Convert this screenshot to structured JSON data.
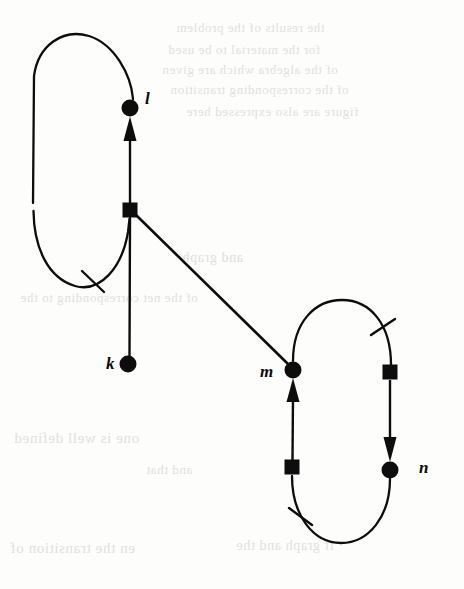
{
  "page": {
    "width": 464,
    "height": 589,
    "background_color": "#fdfdfc",
    "ink_color": "#0d0d0d"
  },
  "diagram": {
    "type": "petri-net",
    "stroke_color": "#0d0d0d",
    "places": [
      {
        "id": "k",
        "label": "k",
        "shape": "filled-circle",
        "cx": 128,
        "cy": 364,
        "r": 8.5,
        "label_x": 106,
        "label_y": 355
      },
      {
        "id": "l",
        "label": "l",
        "shape": "filled-circle",
        "cx": 130,
        "cy": 108,
        "r": 8.5,
        "label_x": 145,
        "label_y": 90
      },
      {
        "id": "m",
        "label": "m",
        "shape": "filled-circle",
        "cx": 293,
        "cy": 370,
        "r": 8.5,
        "label_x": 260,
        "label_y": 363
      },
      {
        "id": "n",
        "label": "n",
        "shape": "filled-circle",
        "cx": 390,
        "cy": 470,
        "r": 8.5,
        "label_x": 419,
        "label_y": 459
      }
    ],
    "transitions": [
      {
        "id": "t1",
        "shape": "filled-square",
        "cx": 130,
        "cy": 210,
        "size": 15
      },
      {
        "id": "t2",
        "shape": "filled-square",
        "cx": 390,
        "cy": 372,
        "size": 15
      },
      {
        "id": "t3",
        "shape": "filled-square",
        "cx": 292,
        "cy": 467,
        "size": 15
      }
    ],
    "arcs": [
      {
        "id": "arc-k-t1",
        "from": "k",
        "to": "t1",
        "kind": "straight",
        "arrowhead": false
      },
      {
        "id": "arc-t1-l",
        "from": "t1",
        "to": "l",
        "kind": "straight",
        "arrowhead": true
      },
      {
        "id": "arc-l-t1-loop",
        "from": "l",
        "to": "t1",
        "kind": "left-loop",
        "arrowhead": false,
        "tick": true
      },
      {
        "id": "arc-t1-m",
        "from": "t1",
        "to": "m",
        "kind": "diagonal",
        "arrowhead": false
      },
      {
        "id": "arc-t3-m",
        "from": "t3",
        "to": "m",
        "kind": "straight",
        "arrowhead": true
      },
      {
        "id": "arc-m-t2",
        "from": "m",
        "to": "t2",
        "kind": "right-loop-top",
        "arrowhead": false,
        "tick": true
      },
      {
        "id": "arc-t2-n",
        "from": "t2",
        "to": "n",
        "kind": "straight",
        "arrowhead": true
      },
      {
        "id": "arc-n-t3",
        "from": "n",
        "to": "t3",
        "kind": "right-loop-bottom",
        "arrowhead": false,
        "tick": true
      }
    ],
    "tick_marks": [
      {
        "id": "tick-left-loop",
        "x": 93,
        "y": 281,
        "angle": 62
      },
      {
        "id": "tick-right-upper",
        "x": 383,
        "y": 327,
        "angle": 65
      },
      {
        "id": "tick-right-lower",
        "x": 300,
        "y": 516,
        "angle": 60
      }
    ]
  },
  "bleedthrough": {
    "note": "Faint mirrored text showing through from the reverse side of the scanned page.",
    "lines": [
      {
        "text": "the results of the problem",
        "x": 176,
        "y": 20,
        "size": 13
      },
      {
        "text": "for the material to be used",
        "x": 168,
        "y": 42,
        "size": 13
      },
      {
        "text": "of the algebra which are given",
        "x": 162,
        "y": 62,
        "size": 13
      },
      {
        "text": "of the corresponding transition",
        "x": 170,
        "y": 82,
        "size": 13
      },
      {
        "text": "figure are also expressed here",
        "x": 186,
        "y": 104,
        "size": 13
      },
      {
        "text": "and graph",
        "x": 182,
        "y": 250,
        "size": 14
      },
      {
        "text": "of the net corresponding to the",
        "x": 20,
        "y": 290,
        "size": 13
      },
      {
        "text": "one is well defined",
        "x": 14,
        "y": 430,
        "size": 15
      },
      {
        "text": "and that",
        "x": 146,
        "y": 462,
        "size": 13
      },
      {
        "text": "en the transition of",
        "x": 10,
        "y": 540,
        "size": 15
      },
      {
        "text": "if graph and the",
        "x": 236,
        "y": 538,
        "size": 14
      }
    ]
  }
}
